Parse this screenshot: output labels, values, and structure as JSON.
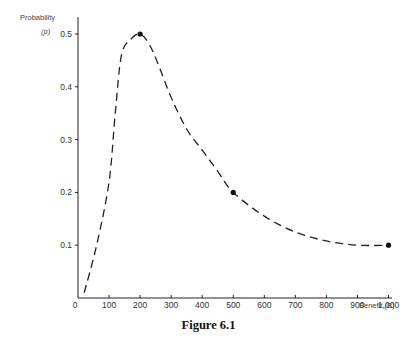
{
  "chart_data": {
    "type": "line",
    "title": "",
    "caption": "Figure 6.1",
    "xlabel": "Benefit (B)",
    "ylabel": "Probability (p)",
    "ylabel_line1": "Probability",
    "ylabel_line2": "(p)",
    "x_ticks": [
      "0",
      "100",
      "200",
      "300",
      "400",
      "500",
      "600",
      "700",
      "800",
      "900",
      "1,000"
    ],
    "y_ticks": [
      "0.1",
      "0.2",
      "0.3",
      "0.4",
      "0.5"
    ],
    "xlim": [
      0,
      1100
    ],
    "ylim": [
      0,
      0.52
    ],
    "grid": false,
    "line_style": "dashed",
    "series": [
      {
        "name": "p(B)",
        "x": [
          20,
          60,
          100,
          120,
          140,
          170,
          200,
          230,
          260,
          300,
          350,
          400,
          450,
          500,
          600,
          700,
          800,
          900,
          1000
        ],
        "y": [
          0.01,
          0.1,
          0.22,
          0.35,
          0.46,
          0.49,
          0.5,
          0.48,
          0.44,
          0.38,
          0.32,
          0.28,
          0.24,
          0.2,
          0.155,
          0.125,
          0.108,
          0.1,
          0.1
        ]
      }
    ],
    "marked_points": [
      {
        "x": 200,
        "y": 0.5
      },
      {
        "x": 500,
        "y": 0.2
      },
      {
        "x": 1000,
        "y": 0.1
      }
    ]
  }
}
